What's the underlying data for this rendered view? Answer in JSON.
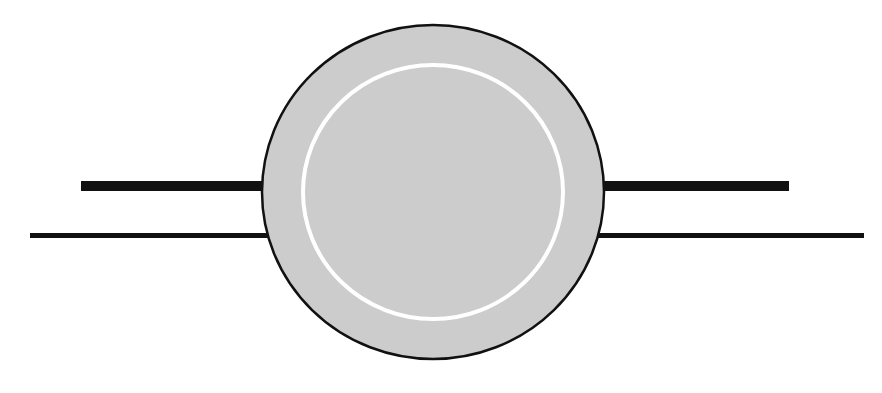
{
  "diagram": {
    "type": "schematic-symbol",
    "colors": {
      "background": "#ffffff",
      "line": "#111111",
      "circle_fill": "#cccccc",
      "circle_stroke": "#111111",
      "inner_ring": "#ffffff"
    },
    "circle": {
      "cx": 433,
      "cy": 192,
      "rx": 171,
      "ry": 167
    },
    "inner_ring": {
      "cx": 433,
      "cy": 192,
      "rx": 130,
      "ry": 127
    },
    "lines": [
      {
        "name": "upper-left-thick-line",
        "x1": 81,
        "x2": 264,
        "y": 186,
        "width": 10
      },
      {
        "name": "upper-right-thick-line",
        "x1": 602,
        "x2": 789,
        "y": 186,
        "width": 10
      },
      {
        "name": "lower-left-thin-line",
        "x1": 30,
        "x2": 268,
        "y": 235.5,
        "width": 5
      },
      {
        "name": "lower-right-thin-line",
        "x1": 598,
        "x2": 864,
        "y": 235.5,
        "width": 5
      }
    ]
  }
}
